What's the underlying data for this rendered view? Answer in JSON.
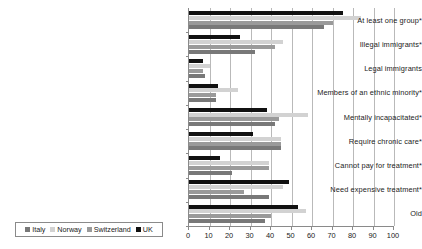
{
  "chart_data": {
    "type": "bar",
    "orientation": "horizontal",
    "title": "",
    "subtitle": "",
    "xlabel": "",
    "ylabel": "",
    "xlim": [
      0,
      100
    ],
    "xticks": [
      0,
      10,
      20,
      30,
      40,
      50,
      60,
      70,
      80,
      90,
      100
    ],
    "xtick_labels": [
      "0",
      "10",
      "20",
      "30",
      "40",
      "50",
      "60",
      "70",
      "80",
      "90",
      "100"
    ],
    "grid": true,
    "grid_axis": "x",
    "legend_position": "bottom-left",
    "categories": [
      "At least one group*",
      "Illegal immigrants*",
      "Legal immigrants",
      "Members of an ethnic minority*",
      "Mentally incapacitated*",
      "Require chronic care*",
      "Cannot pay for treatment*",
      "Need expensive treatment*",
      "Old"
    ],
    "series": [
      {
        "name": "UK",
        "color": "#111111",
        "values": [
          75,
          25,
          7,
          14,
          38,
          31,
          15,
          49,
          53
        ]
      },
      {
        "name": "Norway",
        "color": "#d2d2d2",
        "values": [
          84,
          46,
          10,
          24,
          58,
          45,
          39,
          46,
          57
        ]
      },
      {
        "name": "Switzerland",
        "color": "#9a9a9a",
        "values": [
          70,
          42,
          7,
          13,
          44,
          45,
          39,
          27,
          40
        ]
      },
      {
        "name": "Italy",
        "color": "#787878",
        "values": [
          66,
          32,
          8,
          13,
          42,
          45,
          21,
          39,
          37
        ]
      }
    ]
  },
  "legend": {
    "items": [
      {
        "label": "Italy",
        "color": "#787878"
      },
      {
        "label": "Norway",
        "color": "#d2d2d2"
      },
      {
        "label": "Switzerland",
        "color": "#9a9a9a"
      },
      {
        "label": "UK",
        "color": "#111111"
      }
    ]
  }
}
